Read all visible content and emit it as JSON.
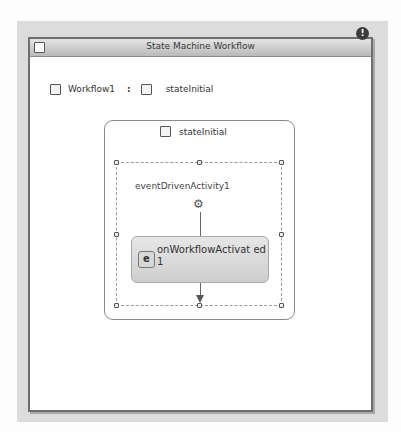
{
  "window": {
    "title": "State Machine Workflow",
    "warning_icon": "exclamation-circle-icon"
  },
  "breadcrumb": {
    "workflow": "Workflow1",
    "separator": ":",
    "state": "stateInitial"
  },
  "state": {
    "name": "stateInitial",
    "event_driven_activity": {
      "name": "eventDrivenActivity1",
      "icon": "gear-icon",
      "child_activity": {
        "name": "onWorkflowActivated1",
        "display_label": "onWorkflowActivat ed1",
        "icon": "workflow-event-icon"
      }
    }
  },
  "colors": {
    "panel_bg": "#dcdcdc",
    "window_border": "#6e6e6e",
    "activity_fill": "#d9d9d9"
  }
}
